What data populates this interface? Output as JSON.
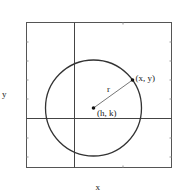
{
  "diagram": {
    "type": "circle-on-coordinate-plane",
    "axis_labels": {
      "x": "x",
      "y": "y"
    },
    "center": {
      "label": "(h, k)"
    },
    "point_on_circle": {
      "label": "(x, y)"
    },
    "radius": {
      "label": "r"
    },
    "colors": {
      "frame": "#555555",
      "axes": "#444444",
      "circle": "#333333",
      "radius_line": "#777777",
      "points": "#111111",
      "text": "#222222"
    }
  }
}
